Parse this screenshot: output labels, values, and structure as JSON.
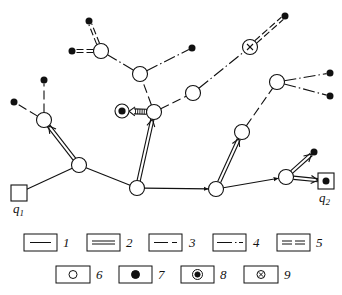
{
  "diagram": {
    "type": "network graph with typed links and node types",
    "terminals": [
      {
        "id": "q1",
        "label": "q",
        "sub": "1",
        "x": 19,
        "y": 193
      },
      {
        "id": "q2",
        "label": "q",
        "sub": "2",
        "x": 326,
        "y": 181
      }
    ],
    "nodes": [
      {
        "id": "n1",
        "type": "open-circle",
        "x": 79,
        "y": 165
      },
      {
        "id": "n2",
        "type": "open-circle",
        "x": 44,
        "y": 120
      },
      {
        "id": "n3",
        "type": "open-circle",
        "x": 137,
        "y": 188
      },
      {
        "id": "n4",
        "type": "open-circle",
        "x": 154,
        "y": 112
      },
      {
        "id": "n5",
        "type": "open-circle",
        "x": 140,
        "y": 74
      },
      {
        "id": "n6",
        "type": "open-circle",
        "x": 101,
        "y": 51
      },
      {
        "id": "n7",
        "type": "open-circle",
        "x": 193,
        "y": 93
      },
      {
        "id": "n8",
        "type": "crossed-circle",
        "x": 250,
        "y": 47
      },
      {
        "id": "n9",
        "type": "open-circle",
        "x": 216,
        "y": 189
      },
      {
        "id": "n10",
        "type": "open-circle",
        "x": 242,
        "y": 132
      },
      {
        "id": "n11",
        "type": "open-circle",
        "x": 277,
        "y": 82
      },
      {
        "id": "n12",
        "type": "open-circle",
        "x": 286,
        "y": 177
      },
      {
        "id": "n13",
        "type": "double-circle",
        "x": 122,
        "y": 111
      },
      {
        "id": "d1",
        "type": "filled-dot",
        "x": 44,
        "y": 80
      },
      {
        "id": "d2",
        "type": "filled-dot",
        "x": 14,
        "y": 102
      },
      {
        "id": "d3",
        "type": "filled-dot",
        "x": 89,
        "y": 21
      },
      {
        "id": "d4",
        "type": "filled-dot",
        "x": 72,
        "y": 51
      },
      {
        "id": "d5",
        "type": "filled-dot",
        "x": 192,
        "y": 48
      },
      {
        "id": "d6",
        "type": "filled-dot",
        "x": 285,
        "y": 16
      },
      {
        "id": "d7",
        "type": "filled-dot",
        "x": 330,
        "y": 73
      },
      {
        "id": "d8",
        "type": "filled-dot",
        "x": 330,
        "y": 96
      },
      {
        "id": "d9",
        "type": "filled-dot",
        "x": 314,
        "y": 152
      }
    ],
    "edges": [
      {
        "from": "q1",
        "to": "n1",
        "style": "1"
      },
      {
        "from": "n1",
        "to": "n3",
        "style": "1"
      },
      {
        "from": "n3",
        "to": "n9",
        "style": "1",
        "arrow": true
      },
      {
        "from": "n9",
        "to": "n12",
        "style": "1",
        "arrow": true
      },
      {
        "from": "n1",
        "to": "n2",
        "style": "2",
        "arrow": true
      },
      {
        "from": "n3",
        "to": "n4",
        "style": "2",
        "arrow": true
      },
      {
        "from": "n9",
        "to": "n10",
        "style": "2",
        "arrow": true
      },
      {
        "from": "n12",
        "to": "d9",
        "style": "2",
        "arrow": true
      },
      {
        "from": "n12",
        "to": "q2",
        "style": "2",
        "arrow": true
      },
      {
        "from": "n2",
        "to": "d1",
        "style": "3"
      },
      {
        "from": "n2",
        "to": "d2",
        "style": "3"
      },
      {
        "from": "n4",
        "to": "n5",
        "style": "3"
      },
      {
        "from": "n4",
        "to": "n7",
        "style": "3"
      },
      {
        "from": "n10",
        "to": "n11",
        "style": "3"
      },
      {
        "from": "n5",
        "to": "n6",
        "style": "4"
      },
      {
        "from": "n5",
        "to": "d5",
        "style": "4"
      },
      {
        "from": "n7",
        "to": "n8",
        "style": "4"
      },
      {
        "from": "n11",
        "to": "d7",
        "style": "4"
      },
      {
        "from": "n11",
        "to": "d8",
        "style": "4"
      },
      {
        "from": "n6",
        "to": "d3",
        "style": "5"
      },
      {
        "from": "n6",
        "to": "d4",
        "style": "5"
      },
      {
        "from": "n8",
        "to": "d6",
        "style": "5"
      },
      {
        "from": "n4",
        "to": "n13",
        "style": "hatched",
        "arrow": true
      }
    ]
  },
  "labels": {
    "q1": {
      "base": "q",
      "sub": "1"
    },
    "q2": {
      "base": "q",
      "sub": "2"
    }
  },
  "legend": {
    "row1": [
      {
        "num": "1",
        "symbol": "single-line"
      },
      {
        "num": "2",
        "symbol": "double-line"
      },
      {
        "num": "3",
        "symbol": "dashed-line"
      },
      {
        "num": "4",
        "symbol": "dash-dot-dot-line"
      },
      {
        "num": "5",
        "symbol": "double-dashed-line"
      }
    ],
    "row2": [
      {
        "num": "6",
        "symbol": "open-circle"
      },
      {
        "num": "7",
        "symbol": "filled-dot"
      },
      {
        "num": "8",
        "symbol": "double-circle"
      },
      {
        "num": "9",
        "symbol": "crossed-circle"
      }
    ]
  }
}
